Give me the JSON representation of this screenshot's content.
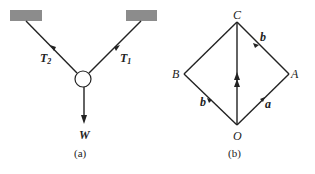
{
  "figure_a": {
    "caption": "(a)",
    "labels": {
      "t2": "T",
      "t2_sub": "2",
      "t1": "T",
      "t1_sub": "1",
      "w": "W"
    },
    "colors": {
      "support": "#8c8c8c",
      "line": "#222222"
    }
  },
  "figure_b": {
    "caption": "(b)",
    "points": {
      "c": "C",
      "b": "B",
      "a": "A",
      "o": "O"
    },
    "vectors": {
      "ob": "b",
      "oa": "a",
      "ac": "b"
    }
  }
}
